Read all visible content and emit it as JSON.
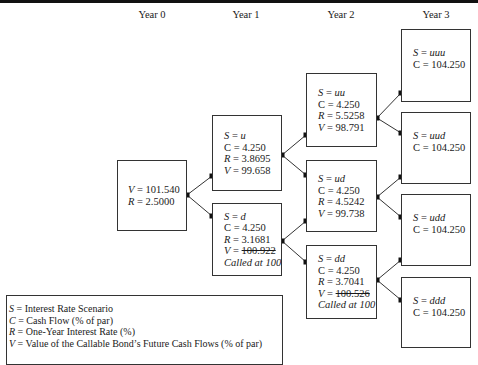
{
  "years": [
    "Year 0",
    "Year 1",
    "Year 2",
    "Year 3"
  ],
  "nodes": {
    "root": {
      "V": "101.540",
      "R": "2.5000"
    },
    "u": {
      "S": "u",
      "C": "4.250",
      "R": "3.8695",
      "V": "99.658"
    },
    "d": {
      "S": "d",
      "C": "4.250",
      "R": "3.1681",
      "V": "100.922",
      "called": "Called at 100"
    },
    "uu": {
      "S": "uu",
      "C": "4.250",
      "R": "5.5258",
      "V": "98.791"
    },
    "ud": {
      "S": "ud",
      "C": "4.250",
      "R": "4.5242",
      "V": "99.738"
    },
    "dd": {
      "S": "dd",
      "C": "4.250",
      "R": "3.7041",
      "V": "100.526",
      "called": "Called at 100"
    },
    "uuu": {
      "S": "uuu",
      "C": "104.250"
    },
    "uud": {
      "S": "uud",
      "C": "104.250"
    },
    "udd": {
      "S": "udd",
      "C": "104.250"
    },
    "ddd": {
      "S": "ddd",
      "C": "104.250"
    }
  },
  "labels": {
    "S": "S",
    "C": "C",
    "R": "R",
    "V": "V",
    "eq": " = "
  },
  "legend": {
    "rows": [
      {
        "sym": "S",
        "text": " = Interest Rate Scenario"
      },
      {
        "sym": "C",
        "text": " = Cash Flow (% of par)"
      },
      {
        "sym": "R",
        "text": " = One-Year Interest Rate (%)"
      },
      {
        "sym": "V",
        "text": " = Value of the Callable Bond’s Future Cash Flows (% of par)"
      }
    ]
  },
  "colors": {
    "line": "#333333",
    "dot": "#111111"
  }
}
